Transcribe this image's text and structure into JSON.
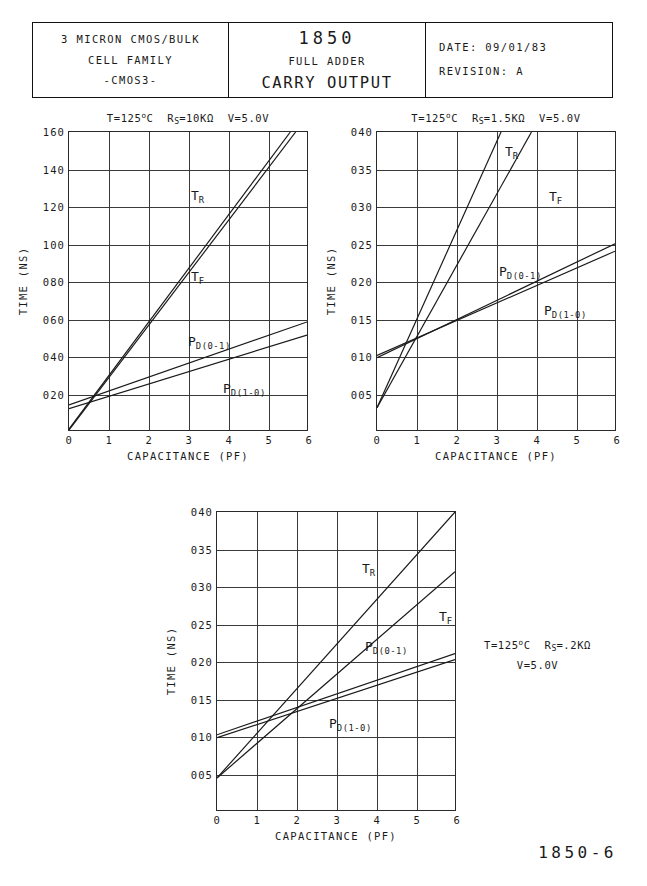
{
  "title_block": {
    "left": {
      "line1": "3 MICRON CMOS/BULK",
      "line2": "CELL FAMILY",
      "line3": "-CMOS3-"
    },
    "middle": {
      "part_number": "1850",
      "family": "FULL ADDER",
      "function": "CARRY OUTPUT"
    },
    "right": {
      "date_label": "DATE:",
      "date_value": "09/01/83",
      "revision_label": "REVISION:",
      "revision_value": "A"
    }
  },
  "sheet_number": "1850-6",
  "axis": {
    "xlabel": "CAPACITANCE (PF)",
    "ylabel": "TIME (NS)"
  },
  "chart_data": [
    {
      "id": "chart-1",
      "type": "line",
      "title": "T=125°C  R_S=10KΩ  V=5.0V",
      "title_parts": {
        "t": "T=125",
        "deg": "o",
        "c": "C",
        "rs_pre": "R",
        "rs_sub": "S",
        "rs_val": "=10KΩ",
        "v": "V=5.0V"
      },
      "conditions": {
        "temperature_c": 125,
        "source_resistance": "10KΩ",
        "supply_voltage": "5.0V"
      },
      "xlabel": "CAPACITANCE (PF)",
      "ylabel": "TIME (NS)",
      "xlim": [
        0,
        6
      ],
      "ylim": [
        0,
        160
      ],
      "xticks": [
        "0",
        "1",
        "2",
        "3",
        "4",
        "5",
        "6"
      ],
      "yticks": [
        "160",
        "140",
        "120",
        "100",
        "080",
        "060",
        "040",
        "020"
      ],
      "ytick_values": [
        160,
        140,
        120,
        100,
        80,
        60,
        40,
        20
      ],
      "grid": true,
      "x": [
        0,
        6
      ],
      "series": [
        {
          "name": "T_R",
          "label": "T",
          "sublabel": "R",
          "values": [
            0.5,
            172.0
          ],
          "x_at_top": 5.56,
          "color": "#1a1a1a"
        },
        {
          "name": "T_F",
          "label": "T",
          "sublabel": "F",
          "values": [
            0.0,
            168.0
          ],
          "x_at_top": 5.71,
          "color": "#1a1a1a"
        },
        {
          "name": "P_D(0-1)",
          "label": "P",
          "sublabel": "D(0-1)",
          "values": [
            13.5,
            58.0
          ],
          "color": "#1a1a1a"
        },
        {
          "name": "P_D(1-0)",
          "label": "P",
          "sublabel": "D(1-0)",
          "values": [
            11.5,
            51.0
          ],
          "color": "#1a1a1a"
        }
      ]
    },
    {
      "id": "chart-2",
      "type": "line",
      "title": "T=125°C  R_S=1.5KΩ  V=5.0V",
      "title_parts": {
        "t": "T=125",
        "deg": "o",
        "c": "C",
        "rs_pre": "R",
        "rs_sub": "S",
        "rs_val": "=1.5KΩ",
        "v": "V=5.0V"
      },
      "conditions": {
        "temperature_c": 125,
        "source_resistance": "1.5KΩ",
        "supply_voltage": "5.0V"
      },
      "xlabel": "CAPACITANCE (PF)",
      "ylabel": "TIME (NS)",
      "xlim": [
        0,
        6
      ],
      "ylim": [
        0,
        40
      ],
      "xticks": [
        "0",
        "1",
        "2",
        "3",
        "4",
        "5",
        "6"
      ],
      "yticks": [
        "040",
        "035",
        "030",
        "025",
        "020",
        "015",
        "010",
        "005"
      ],
      "ytick_values": [
        40,
        35,
        30,
        25,
        20,
        15,
        10,
        5
      ],
      "grid": true,
      "x": [
        0,
        6
      ],
      "series": [
        {
          "name": "T_R",
          "label": "T",
          "sublabel": "R",
          "values": [
            3.0,
            74.0
          ],
          "x_at_top": 3.12,
          "color": "#1a1a1a"
        },
        {
          "name": "T_F",
          "label": "T",
          "sublabel": "F",
          "values": [
            3.0,
            60.0
          ],
          "x_at_top": 3.89,
          "color": "#1a1a1a"
        },
        {
          "name": "P_D(0-1)",
          "label": "P",
          "sublabel": "D(0-1)",
          "values": [
            9.7,
            25.0
          ],
          "color": "#1a1a1a"
        },
        {
          "name": "P_D(1-0)",
          "label": "P",
          "sublabel": "D(1-0)",
          "values": [
            10.0,
            24.0
          ],
          "color": "#1a1a1a"
        }
      ]
    },
    {
      "id": "chart-3",
      "type": "line",
      "title": "",
      "annotation_line1_parts": {
        "t": "T=125",
        "deg": "o",
        "c": "C",
        "rs_pre": "R",
        "rs_sub": "S",
        "rs_val": "=.2KΩ"
      },
      "annotation_line2": "V=5.0V",
      "conditions": {
        "temperature_c": 125,
        "source_resistance": ".2KΩ",
        "supply_voltage": "5.0V"
      },
      "xlabel": "CAPACITANCE (PF)",
      "ylabel": "TIME (NS)",
      "xlim": [
        0,
        6
      ],
      "ylim": [
        0,
        40
      ],
      "xticks": [
        "0",
        "1",
        "2",
        "3",
        "4",
        "5",
        "6"
      ],
      "yticks": [
        "040",
        "035",
        "030",
        "025",
        "020",
        "015",
        "010",
        "005"
      ],
      "ytick_values": [
        40,
        35,
        30,
        25,
        20,
        15,
        10,
        5
      ],
      "grid": true,
      "x": [
        0,
        6
      ],
      "series": [
        {
          "name": "T_R",
          "label": "T",
          "sublabel": "R",
          "values": [
            4.3,
            40.0
          ],
          "color": "#1a1a1a"
        },
        {
          "name": "T_F",
          "label": "T",
          "sublabel": "F",
          "values": [
            4.3,
            32.0
          ],
          "color": "#1a1a1a"
        },
        {
          "name": "P_D(0-1)",
          "label": "P",
          "sublabel": "D(0-1)",
          "values": [
            10.1,
            21.0
          ],
          "color": "#1a1a1a"
        },
        {
          "name": "P_D(1-0)",
          "label": "P",
          "sublabel": "D(1-0)",
          "values": [
            9.7,
            20.2
          ],
          "color": "#1a1a1a"
        }
      ]
    }
  ]
}
